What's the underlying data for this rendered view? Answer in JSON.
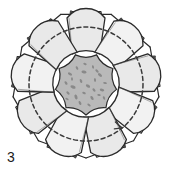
{
  "figure": {
    "label": "3",
    "caption_number": "3",
    "kind": "botanical-cross-section-diagram",
    "background_color": "#ffffff",
    "canvas": {
      "width": 172,
      "height": 176
    }
  },
  "colors": {
    "outline": "#2b2b2b",
    "outline_light": "#555555",
    "lobe_fill": "#e9e9e9",
    "lobe_fill_light": "#f2f2f2",
    "tab_fill": "#dcdcdc",
    "tab_edge_dark": "#4a4a4a",
    "core_fill": "#b9b9b9",
    "core_speckle": "#7a7a7a",
    "dashed_circle": "#3a3a3a",
    "shadow": "#9a9a9a"
  },
  "geometry": {
    "center": {
      "x": 86,
      "y": 84
    },
    "lobe_count": 9,
    "outer_polygon_radius": 74,
    "lobe_ring_radius": 50,
    "core_radius": 27,
    "dashed_circle_radius": 57,
    "dashed_dash_pattern": "4 3"
  },
  "parts": [
    {
      "id": "outer-wall",
      "name": "outer-polygonal-wall",
      "description": "nine-sided polygonal envelope with flattened facets"
    },
    {
      "id": "marginal-tabs",
      "name": "marginal-tab-ring",
      "description": "small rectangular tabs projecting at each facet"
    },
    {
      "id": "lobe-ring",
      "name": "lobe-ring",
      "description": "nine rounded petal-like lobes arranged radially"
    },
    {
      "id": "central-core",
      "name": "central-core",
      "description": "darker speckled central mass"
    },
    {
      "id": "dashed-circle",
      "name": "dashed-reference-circle",
      "description": "dashed construction circle crossing the lobes"
    },
    {
      "id": "arrow-mark",
      "name": "arrow-marker",
      "description": "small arrow tick on the dashed circle, lower right"
    }
  ],
  "core_speckles": [
    {
      "x": -16,
      "y": -10,
      "r": 1.7,
      "a": 28
    },
    {
      "x": -9,
      "y": -16,
      "r": 1.4,
      "a": 62
    },
    {
      "x": -2,
      "y": -12,
      "r": 1.9,
      "a": 10
    },
    {
      "x": 7,
      "y": -17,
      "r": 1.3,
      "a": 75
    },
    {
      "x": 14,
      "y": -9,
      "r": 1.8,
      "a": 40
    },
    {
      "x": 19,
      "y": -1,
      "r": 1.4,
      "a": 5
    },
    {
      "x": -20,
      "y": -1,
      "r": 1.5,
      "a": 55
    },
    {
      "x": -13,
      "y": 3,
      "r": 2.0,
      "a": 20
    },
    {
      "x": -5,
      "y": -3,
      "r": 1.5,
      "a": 68
    },
    {
      "x": 2,
      "y": 2,
      "r": 1.8,
      "a": 33
    },
    {
      "x": 9,
      "y": -4,
      "r": 1.4,
      "a": 80
    },
    {
      "x": 16,
      "y": 6,
      "r": 1.7,
      "a": 15
    },
    {
      "x": -18,
      "y": 9,
      "r": 1.5,
      "a": 48
    },
    {
      "x": -10,
      "y": 13,
      "r": 1.9,
      "a": 72
    },
    {
      "x": -2,
      "y": 9,
      "r": 1.4,
      "a": 25
    },
    {
      "x": 6,
      "y": 14,
      "r": 1.7,
      "a": 58
    },
    {
      "x": 13,
      "y": 11,
      "r": 1.3,
      "a": 12
    },
    {
      "x": -6,
      "y": 19,
      "r": 1.6,
      "a": 65
    },
    {
      "x": 3,
      "y": 21,
      "r": 1.4,
      "a": 38
    },
    {
      "x": -14,
      "y": -5,
      "r": 1.3,
      "a": 88
    },
    {
      "x": 11,
      "y": -13,
      "r": 1.5,
      "a": 44
    },
    {
      "x": -1,
      "y": -20,
      "r": 1.3,
      "a": 18
    },
    {
      "x": 18,
      "y": 14,
      "r": 1.4,
      "a": 70
    },
    {
      "x": -19,
      "y": 15,
      "r": 1.3,
      "a": 30
    },
    {
      "x": 8,
      "y": 6,
      "r": 1.5,
      "a": 52
    }
  ]
}
